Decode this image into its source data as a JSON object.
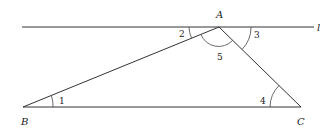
{
  "diagram": {
    "line": {
      "label": "l"
    },
    "points": {
      "A": {
        "label": "A"
      },
      "B": {
        "label": "B"
      },
      "C": {
        "label": "C"
      }
    },
    "angles": [
      {
        "id": "1",
        "label": "1",
        "vertex": "B"
      },
      {
        "id": "2",
        "label": "2",
        "vertex": "A"
      },
      {
        "id": "3",
        "label": "3",
        "vertex": "A"
      },
      {
        "id": "4",
        "label": "4",
        "vertex": "C"
      },
      {
        "id": "5",
        "label": "5",
        "vertex": "A"
      }
    ],
    "colors": {
      "stroke": "#333333",
      "background": "#ffffff"
    }
  }
}
